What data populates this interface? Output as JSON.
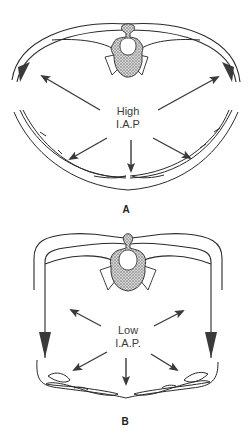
{
  "figures": [
    {
      "id": "A",
      "panel_label": "A",
      "pressure_label_line1": "High",
      "pressure_label_line2": "I.A.P",
      "description": "Cross-section of abdomen with high intra-abdominal pressure; abdominal wall rounded, arrows pushing outward"
    },
    {
      "id": "B",
      "panel_label": "B",
      "pressure_label_line1": "Low",
      "pressure_label_line2": "I.A.P.",
      "description": "Cross-section of abdomen with low intra-abdominal pressure; abdominal wall flattened/squared, arrows pushing outward weaker"
    }
  ],
  "colors": {
    "line": "#2a2a2a",
    "arrow": "#3a3a3a",
    "vertebra_fill": "#9a9a9a",
    "background": "#ffffff"
  }
}
